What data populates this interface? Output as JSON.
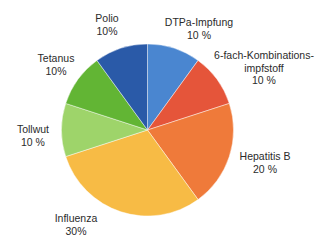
{
  "chart_data": {
    "type": "pie",
    "title": "",
    "start_angle_deg": 0,
    "direction": "clockwise",
    "center": [
      147.5,
      130
    ],
    "radius": 86,
    "slices": [
      {
        "label": "DTPa-Impfung",
        "value": 10,
        "value_text": "10 %",
        "color": "#4a86d0",
        "label_lines": [
          "DTPa-Impfung",
          "10 %"
        ],
        "label_pos": [
          199,
          16
        ]
      },
      {
        "label": "6-fach-Kombinationsimpfstoff",
        "value": 10,
        "value_text": "10 %",
        "color": "#e5553a",
        "label_lines": [
          "6-fach-Kombinations-",
          "impfstoff",
          "10 %"
        ],
        "label_pos": [
          264,
          49
        ]
      },
      {
        "label": "Hepatitis B",
        "value": 20,
        "value_text": "20 %",
        "color": "#ef7a3a",
        "label_lines": [
          "Hepatitis B",
          "20 %"
        ],
        "label_pos": [
          265,
          150
        ]
      },
      {
        "label": "Influenza",
        "value": 30,
        "value_text": "30%",
        "color": "#f7bb45",
        "label_lines": [
          "Influenza",
          "30%"
        ],
        "label_pos": [
          76,
          212
        ]
      },
      {
        "label": "Tollwut",
        "value": 10,
        "value_text": "10 %",
        "color": "#9ed46a",
        "label_lines": [
          "Tollwut",
          "10 %"
        ],
        "label_pos": [
          33,
          123
        ]
      },
      {
        "label": "Tetanus",
        "value": 10,
        "value_text": "10%",
        "color": "#62b534",
        "label_lines": [
          "Tetanus",
          "10%"
        ],
        "label_pos": [
          56,
          52
        ]
      },
      {
        "label": "Polio",
        "value": 10,
        "value_text": "10%",
        "color": "#2a5aa8",
        "label_lines": [
          "Polio",
          "10%"
        ],
        "label_pos": [
          107,
          12
        ]
      }
    ],
    "categories": [
      "DTPa-Impfung",
      "6-fach-Kombinationsimpfstoff",
      "Hepatitis B",
      "Influenza",
      "Tollwut",
      "Tetanus",
      "Polio"
    ],
    "values": [
      10,
      10,
      20,
      30,
      10,
      10,
      10
    ],
    "unit": "%",
    "legend": "none (labels placed beside slices)"
  }
}
